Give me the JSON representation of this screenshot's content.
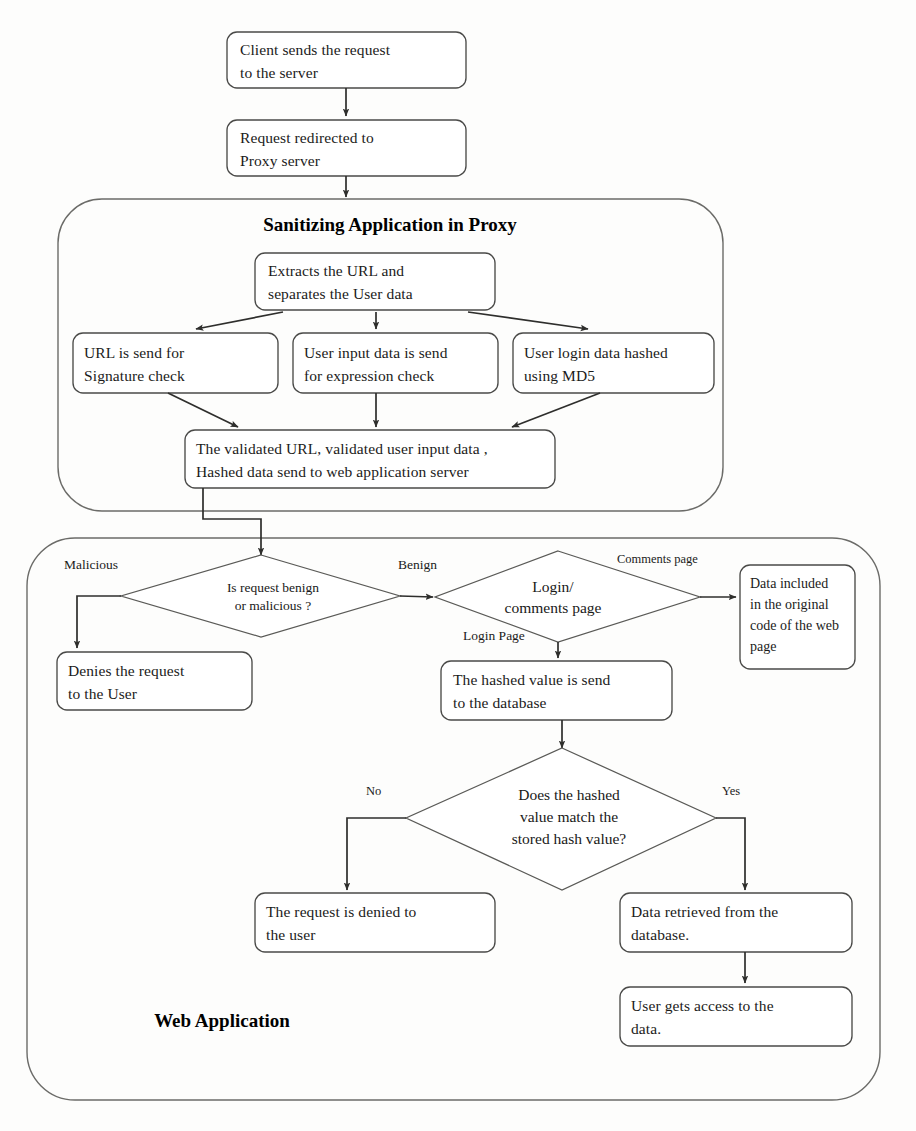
{
  "diagram": {
    "type": "flowchart",
    "background_color": "#fdfdfc",
    "line_color": "#2e2e2c",
    "box_fill": "#ffffff",
    "containers": [
      {
        "id": "proxy",
        "label": "Sanitizing Application in Proxy"
      },
      {
        "id": "webapp",
        "label": "Web Application"
      }
    ],
    "nodes": {
      "client_request": {
        "line1": "Client sends the request",
        "line2": "to the server"
      },
      "request_redirected": {
        "line1": "Request redirected to",
        "line2": "Proxy server"
      },
      "extracts_url": {
        "line1": "Extracts the URL and",
        "line2": "separates the User data"
      },
      "url_signature": {
        "line1": "URL is send for",
        "line2": "Signature check"
      },
      "user_input_expression": {
        "line1": "User input data is send",
        "line2": "for expression check"
      },
      "user_login_md5": {
        "line1": "User login data hashed",
        "line2": "using MD5"
      },
      "validated_send": {
        "line1": "The validated URL, validated user input data ,",
        "line2": "Hashed data send to web application server"
      },
      "denies_request": {
        "line1": "Denies the request",
        "line2": "to the User"
      },
      "hashed_value_db": {
        "line1": "The hashed value is send",
        "line2": "to the database"
      },
      "data_included": {
        "line1": "Data included",
        "line2": "in the original",
        "line3": "code of the web",
        "line4": "page"
      },
      "request_denied": {
        "line1": "The request is denied to",
        "line2": "the user"
      },
      "data_retrieved": {
        "line1": "Data retrieved from the",
        "line2": "database."
      },
      "user_access": {
        "line1": "User gets access to the",
        "line2": "data."
      }
    },
    "decisions": {
      "benign_or_malicious": {
        "line1": "Is request benign",
        "line2": "or malicious ?"
      },
      "login_or_comments": {
        "line1": "Login/",
        "line2": "comments page"
      },
      "hash_match": {
        "line1": "Does the hashed",
        "line2": "value match the",
        "line3": "stored hash value?"
      }
    },
    "edge_labels": {
      "malicious": "Malicious",
      "benign": "Benign",
      "comments_page": "Comments page",
      "login_page": "Login Page",
      "no": "No",
      "yes": "Yes"
    }
  }
}
